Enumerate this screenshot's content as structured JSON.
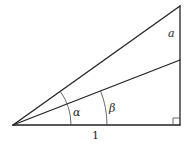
{
  "diagram": {
    "type": "right-triangle-angles",
    "labels": {
      "opposite_segment": "a",
      "angle_outer": "α",
      "angle_inner": "β",
      "base": "1"
    },
    "colors": {
      "stroke": "#222222",
      "background": "#ffffff"
    }
  }
}
